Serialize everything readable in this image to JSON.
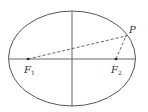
{
  "diagram": {
    "type": "ellipse-foci",
    "colors": {
      "stroke": "#555555",
      "background": "#ffffff",
      "text": "#333333"
    },
    "ellipse": {
      "cx": 72,
      "cy": 58.5,
      "rx": 63.5,
      "ry": 47.5
    },
    "axes": {
      "x_axis": {
        "x1": 9,
        "y1": 59,
        "x2": 136,
        "y2": 59
      },
      "y_axis": {
        "x1": 72,
        "y1": 11,
        "x2": 72,
        "y2": 106
      }
    },
    "points": {
      "F1": {
        "label": "F",
        "sub": "1",
        "x": 28,
        "y": 59
      },
      "F2": {
        "label": "F",
        "sub": "2",
        "x": 116,
        "y": 59
      },
      "P": {
        "label": "P",
        "x": 126,
        "y": 36
      }
    },
    "segments": [
      {
        "from": "F1",
        "to": "P",
        "style": "dashed"
      },
      {
        "from": "F2",
        "to": "P",
        "style": "dashed"
      }
    ]
  }
}
